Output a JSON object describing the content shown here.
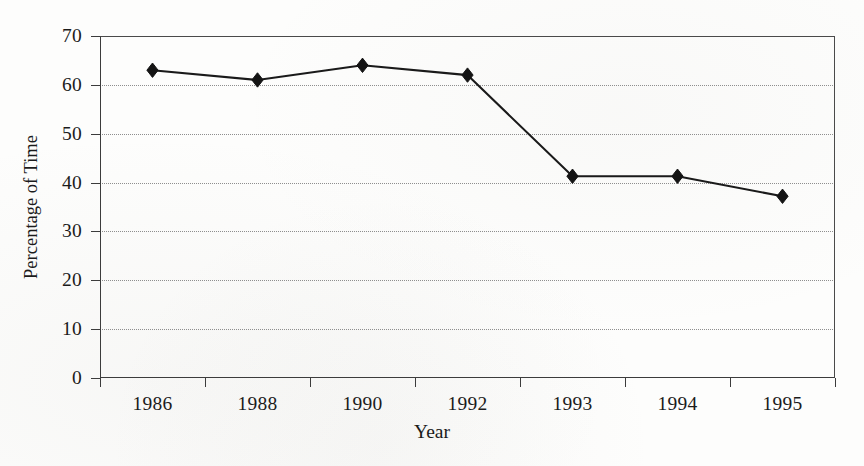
{
  "chart_data": {
    "type": "line",
    "title": "",
    "subtitle": "",
    "xlabel": "Year",
    "ylabel": "Percentage of Time",
    "categories": [
      "1986",
      "1988",
      "1990",
      "1992",
      "1993",
      "1994",
      "1995"
    ],
    "values": [
      63,
      61,
      64,
      62,
      41.3,
      41.3,
      37.2
    ],
    "series": [
      {
        "name": "Percentage of Time",
        "values": [
          63,
          61,
          64,
          62,
          41.3,
          41.3,
          37.2
        ]
      }
    ],
    "ylim": [
      0,
      70
    ],
    "ytick_step": 10,
    "yticks": [
      "0",
      "10",
      "20",
      "30",
      "40",
      "50",
      "60",
      "70"
    ],
    "grid": true,
    "grid_axis": "y",
    "grid_style": "dotted",
    "legend": "none",
    "legend_position": "none",
    "marker": "diamond",
    "line_color": "#1a1a1a",
    "marker_color": "#141414",
    "grid_color": "#8e8e8e",
    "axis_color": "#3c3c3c",
    "background_color": "#fdfdfc",
    "annotations": []
  }
}
